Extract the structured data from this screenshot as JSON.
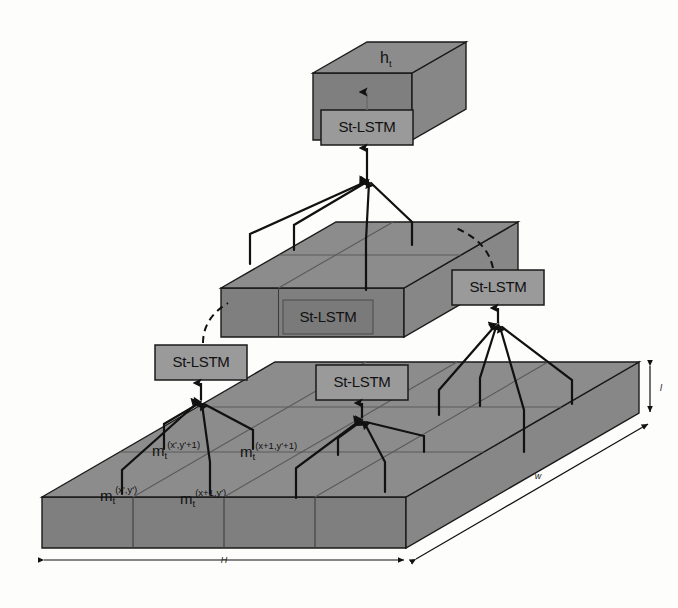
{
  "figure": {
    "type": "architecture-diagram",
    "background_color": "#fdfdfc",
    "slab_fill": "#8c8c8c",
    "slab_fill_side": "#7e7e7e",
    "slab_fill_front": "#858585",
    "box_fill": "#9a9a9a",
    "stroke_color": "#1a1a1a",
    "grid_color": "#5f5f5f"
  },
  "labels": {
    "top_volume": "h",
    "top_volume_sub": "t",
    "st_lstm": "St-LSTM"
  },
  "units": [
    {
      "id": "top",
      "label": "St-LSTM",
      "level": 3
    },
    {
      "id": "mid-hidden",
      "label": "St-LSTM",
      "level": 2
    },
    {
      "id": "mid-right",
      "label": "St-LSTM",
      "level": 2
    },
    {
      "id": "bottom-left",
      "label": "St-LSTM",
      "level": 1
    },
    {
      "id": "bottom-center",
      "label": "St-LSTM",
      "level": 1
    }
  ],
  "memory_labels": [
    {
      "id": "m-xp-yp",
      "base": "m",
      "sub": "t",
      "sup": "(x',y')",
      "x": 100,
      "y": 497
    },
    {
      "id": "m-xp1-yp",
      "base": "m",
      "sub": "t",
      "sup": "(x+1,y')",
      "x": 180,
      "y": 500
    },
    {
      "id": "m-xp-yp1",
      "base": "m",
      "sub": "t",
      "sup": "(x',y'+1)",
      "x": 152,
      "y": 452
    },
    {
      "id": "m-xp1-yp1",
      "base": "m",
      "sub": "t",
      "sup": "(x+1,y'+1)",
      "x": 240,
      "y": 453
    }
  ],
  "dimensions": [
    {
      "id": "dim-H",
      "label": "H",
      "orientation": "horizontal-bottom"
    },
    {
      "id": "dim-w",
      "label": "w",
      "orientation": "diagonal-right"
    },
    {
      "id": "dim-l",
      "label": "l",
      "orientation": "vertical-right"
    }
  ],
  "legend": {
    "levels": [
      {
        "name": "input-feature-slab",
        "grid": "4x3"
      },
      {
        "name": "intermediate-slab",
        "grid": "2x2"
      },
      {
        "name": "output-volume",
        "grid": "1x1"
      }
    ]
  }
}
